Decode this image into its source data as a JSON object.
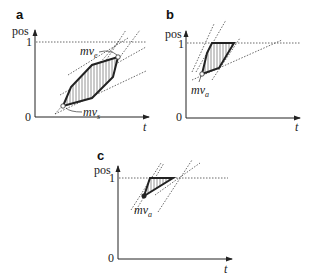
{
  "figure": {
    "panels": [
      {
        "id": "a",
        "label": "a",
        "y_axis_label": "pos",
        "x_axis_label": "t",
        "tick_top": "1",
        "tick_origin": "0",
        "annotations": [
          {
            "text": "mv",
            "sub": "e"
          },
          {
            "text": "mv",
            "sub": "s"
          }
        ]
      },
      {
        "id": "b",
        "label": "b",
        "y_axis_label": "pos",
        "x_axis_label": "t",
        "tick_top": "1",
        "tick_origin": "0",
        "annotations": [
          {
            "text": "mv",
            "sub": "a"
          }
        ]
      },
      {
        "id": "c",
        "label": "c",
        "y_axis_label": "pos",
        "x_axis_label": "t",
        "tick_top": "1",
        "tick_origin": "0",
        "annotations": [
          {
            "text": "mv",
            "sub": "a"
          }
        ]
      }
    ]
  }
}
